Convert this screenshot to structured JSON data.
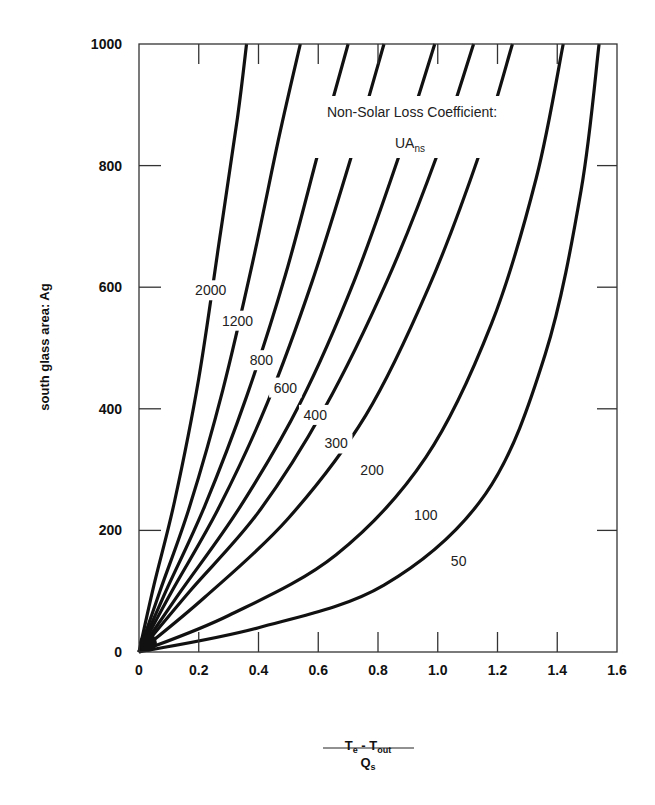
{
  "chart_data": {
    "type": "line",
    "title": "",
    "xlabel": "(T_e - T_out) / Q_s",
    "xlabel_parts": {
      "numerator": "T",
      "num_sub1": "e",
      "minus": " - T",
      "num_sub2": "out",
      "denominator": "Q",
      "den_sub": "s"
    },
    "ylabel": "south glass area: Ag",
    "xlim": [
      0,
      1.6
    ],
    "ylim": [
      0,
      1000
    ],
    "xticks": [
      0,
      0.2,
      0.4,
      0.6,
      0.8,
      1.0,
      1.2,
      1.4,
      1.6
    ],
    "xtick_labels": [
      "0",
      "0.2",
      "0.4",
      "0.6",
      "0.8",
      "1.0",
      "1.2",
      "1.4",
      "1.6"
    ],
    "yticks": [
      0,
      200,
      400,
      600,
      800,
      1000
    ],
    "ytick_labels": [
      "0",
      "200",
      "400",
      "600",
      "800",
      "1000"
    ],
    "grid": false,
    "legend": {
      "title": "Non-Solar Loss Coefficient:",
      "symbol": "UA",
      "symbol_sub": "ns",
      "position": "upper-center"
    },
    "series": [
      {
        "name": "2000",
        "label": "2000",
        "x": [
          0,
          0.05,
          0.12,
          0.2,
          0.27,
          0.33,
          0.36
        ],
        "y": [
          0,
          110,
          250,
          450,
          680,
          880,
          1000
        ],
        "label_at": [
          0.24,
          590
        ]
      },
      {
        "name": "1200",
        "label": "1200",
        "x": [
          0,
          0.07,
          0.17,
          0.28,
          0.38,
          0.47,
          0.54
        ],
        "y": [
          0,
          100,
          240,
          430,
          640,
          850,
          1000
        ],
        "label_at": [
          0.33,
          540
        ]
      },
      {
        "name": "800",
        "label": "800",
        "x": [
          0,
          0.09,
          0.22,
          0.36,
          0.49,
          0.61,
          0.7
        ],
        "y": [
          0,
          100,
          240,
          420,
          620,
          840,
          1000
        ],
        "label_at": [
          0.41,
          475
        ]
      },
      {
        "name": "600",
        "label": "600",
        "x": [
          0,
          0.11,
          0.27,
          0.43,
          0.58,
          0.72,
          0.82
        ],
        "y": [
          0,
          100,
          240,
          410,
          610,
          830,
          1000
        ],
        "label_at": [
          0.49,
          430
        ]
      },
      {
        "name": "400",
        "label": "400",
        "x": [
          0,
          0.14,
          0.34,
          0.54,
          0.72,
          0.88,
          0.99
        ],
        "y": [
          0,
          100,
          240,
          410,
          610,
          830,
          1000
        ],
        "label_at": [
          0.59,
          385
        ]
      },
      {
        "name": "300",
        "label": "300",
        "x": [
          0,
          0.17,
          0.4,
          0.62,
          0.83,
          1.0,
          1.12
        ],
        "y": [
          0,
          100,
          230,
          400,
          610,
          820,
          1000
        ],
        "label_at": [
          0.66,
          338
        ]
      },
      {
        "name": "200",
        "label": "200",
        "x": [
          0,
          0.22,
          0.5,
          0.76,
          0.97,
          1.14,
          1.25
        ],
        "y": [
          0,
          90,
          220,
          390,
          600,
          820,
          1000
        ],
        "label_at": [
          0.78,
          295
        ]
      },
      {
        "name": "100",
        "label": "100",
        "x": [
          0,
          0.3,
          0.66,
          0.96,
          1.18,
          1.33,
          1.42
        ],
        "y": [
          0,
          60,
          160,
          320,
          540,
          780,
          1000
        ],
        "label_at": [
          0.96,
          220
        ]
      },
      {
        "name": "50",
        "label": "50",
        "x": [
          0,
          0.4,
          0.82,
          1.16,
          1.36,
          1.48,
          1.54
        ],
        "y": [
          0,
          40,
          110,
          260,
          490,
          760,
          1000
        ],
        "label_at": [
          1.07,
          145
        ]
      }
    ]
  }
}
